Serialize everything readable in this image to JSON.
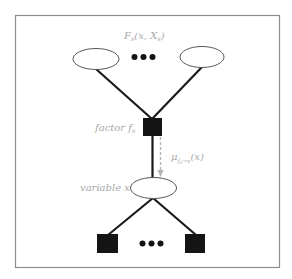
{
  "diagram": {
    "type": "factor-graph",
    "colors": {
      "frame": "#8c8c8c",
      "edge": "#1a1a1a",
      "node_fill": "#ffffff",
      "node_stroke": "#555555",
      "factor_fill": "#141414",
      "label": "#a8a8a8",
      "message_arrow": "#b4b4b4"
    },
    "labels": {
      "subtree_function": "F",
      "subtree_function_sub": "s",
      "subtree_args_open": "(x, X",
      "subtree_args_sub": "s",
      "subtree_args_close": ")",
      "factor": "factor f",
      "factor_sub": "s",
      "variable": "variable x",
      "message_mu": "μ",
      "message_sub_f": "f",
      "message_sub_s": "s",
      "message_sub_arrow": "→x",
      "message_arg": "(x)",
      "ellipsis_glyph": "●"
    },
    "nodes": {
      "top_variables": [
        "left-variable",
        "right-variable"
      ],
      "factor": "f_s",
      "variable": "x",
      "bottom_factors": [
        "left-factor",
        "right-factor"
      ]
    },
    "edges": [
      {
        "from": "left-variable",
        "to": "f_s"
      },
      {
        "from": "right-variable",
        "to": "f_s"
      },
      {
        "from": "f_s",
        "to": "x"
      },
      {
        "from": "x",
        "to": "left-factor"
      },
      {
        "from": "x",
        "to": "right-factor"
      }
    ],
    "message": {
      "from": "f_s",
      "to": "x",
      "style": "dashed-arrow"
    }
  }
}
